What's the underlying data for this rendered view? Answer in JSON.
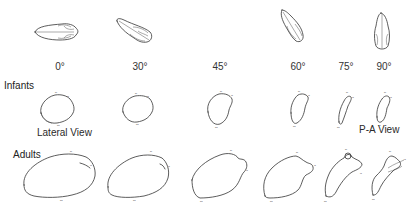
{
  "figure": {
    "angles": [
      "0°",
      "30°",
      "45°",
      "60°",
      "75°",
      "90°"
    ],
    "rows": {
      "infants_label": "Infants",
      "adults_label": "Adults"
    },
    "view_labels": {
      "lateral": "Lateral View",
      "pa": "P-A View"
    },
    "top_skull_views": [
      "0°",
      "30°",
      "60°",
      "90°"
    ],
    "colors": {
      "line": "#333333",
      "background": "#ffffff"
    }
  }
}
